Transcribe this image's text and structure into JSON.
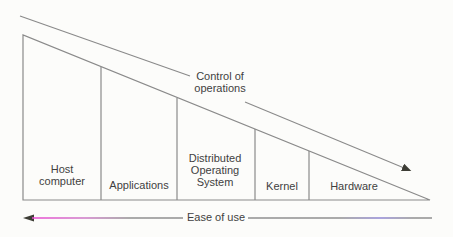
{
  "diagram": {
    "control_arrow": {
      "label": "Control of operations"
    },
    "ease_arrow": {
      "label": "Ease of use"
    },
    "sections": [
      {
        "label": "Host computer"
      },
      {
        "label": "Applications"
      },
      {
        "label": "Distributed Operating System"
      },
      {
        "label": "Kernel"
      },
      {
        "label": "Hardware"
      }
    ]
  },
  "colors": {
    "background": "#fcfcfa",
    "line": "#8a8a8a",
    "line_dark": "#7b7b7b",
    "text": "#3f3f3f",
    "arrowhead": "#3d3d35",
    "ease_magenta": "#ea4ad2",
    "ease_magenta_fade": "#cd79c6",
    "ease_gray": "#8f8f8f",
    "ease_purple": "#8f86d4"
  }
}
